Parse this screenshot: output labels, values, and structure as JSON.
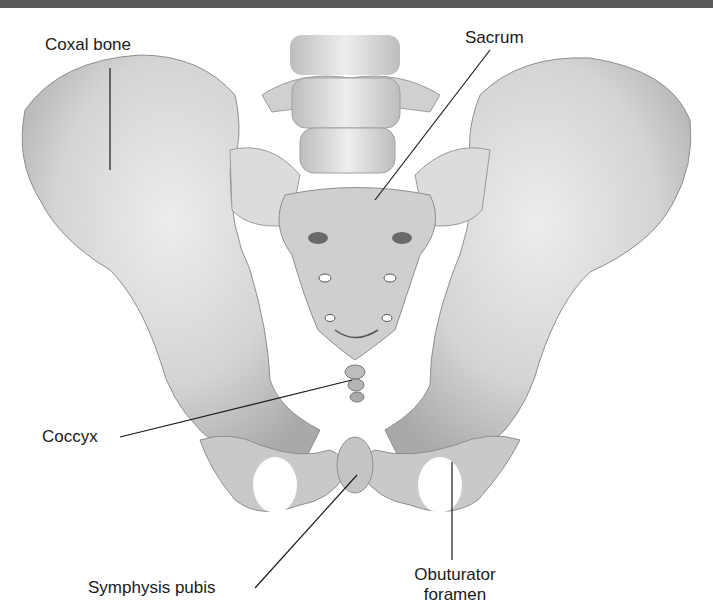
{
  "figure": {
    "labels": {
      "coxal_bone": "Coxal bone",
      "sacrum": "Sacrum",
      "coccyx": "Coccyx",
      "symphysis_pubis": "Symphysis pubis",
      "obturator_foramen_line1": "Obuturator",
      "obturator_foramen_line2": "foramen"
    },
    "colors": {
      "bone": "#d9d9d9",
      "bone_shadow": "#a8a8a8",
      "header_bar": "#5a5a5a",
      "label_text": "#1a1a1a"
    }
  }
}
